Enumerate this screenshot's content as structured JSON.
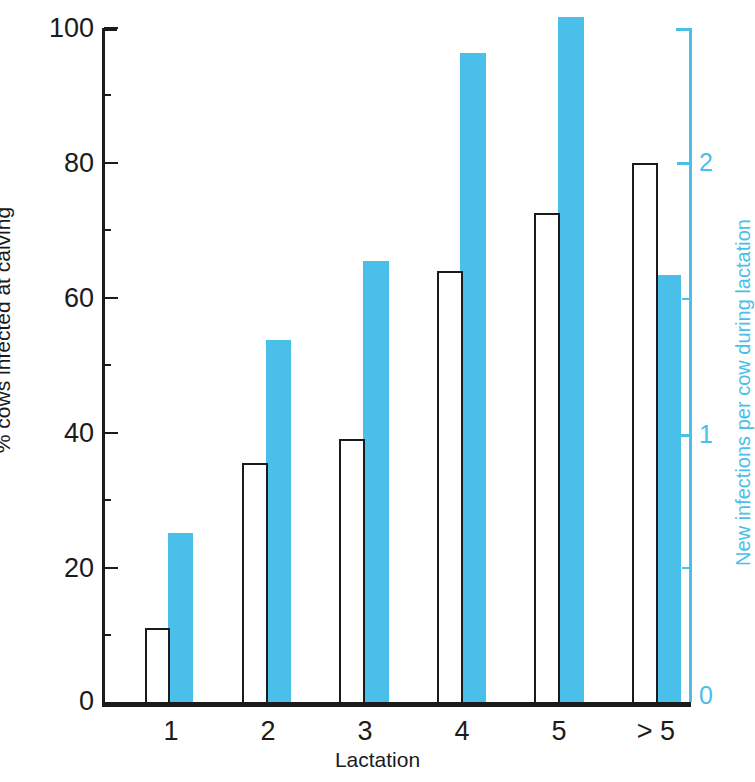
{
  "chart_data": {
    "type": "bar",
    "title": "",
    "subtitle": "",
    "xlabel": "Lactation",
    "categories": [
      "1",
      "2",
      "3",
      "4",
      "5",
      "> 5"
    ],
    "grid": false,
    "legend": "none",
    "axes": {
      "left": {
        "label": "% cows infected at calving",
        "ticks": [
          0,
          20,
          40,
          60,
          80,
          100
        ],
        "minor_ticks": [
          10,
          30,
          50,
          70,
          90
        ],
        "lim": [
          0,
          100
        ],
        "color": "#1b1b1b"
      },
      "right": {
        "label": "New infections per cow during lactation",
        "ticks": [
          0,
          1,
          2
        ],
        "minor_ticks": [
          0.5,
          1.5
        ],
        "lim": [
          0,
          2.4
        ],
        "color": "#49bfea"
      }
    },
    "series": [
      {
        "name": "% cows infected at calving",
        "axis": "left",
        "style": "white-outline",
        "color": "#ffffff",
        "edge_color": "#1b1b1b",
        "values": [
          11,
          35.5,
          39,
          64,
          72.5,
          80
        ]
      },
      {
        "name": "New infections per cow during lactation",
        "axis": "right",
        "style": "filled",
        "color": "#49bfea",
        "edge_color": "#49bfea",
        "values": [
          0.6,
          1.29,
          1.57,
          2.31,
          2.44,
          1.52
        ]
      }
    ]
  },
  "labels": {
    "y_left_title": "% cows infected at calving",
    "y_right_title": "New infections per cow during lactation",
    "x_title": "Lactation",
    "left_ticks": [
      "100",
      "80",
      "60",
      "40",
      "20",
      "0"
    ],
    "right_ticks": [
      "2",
      "1",
      "0"
    ],
    "x_ticks": [
      "1",
      "2",
      "3",
      "4",
      "5",
      "> 5"
    ]
  },
  "colors": {
    "accent_blue": "#49bfea",
    "ink": "#1b1b1b",
    "background": "#ffffff"
  }
}
